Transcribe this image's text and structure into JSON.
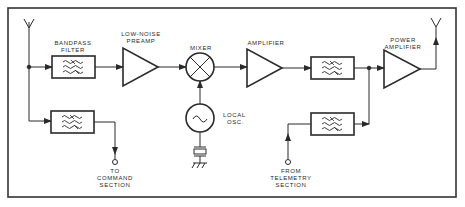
{
  "diagram": {
    "colors": {
      "line": "#2a2a2a",
      "background": "#ffffff",
      "frame": "#333333"
    },
    "labels": {
      "bandpass_filter": [
        "BANDPASS",
        "FILTER"
      ],
      "low_noise_preamp": [
        "LOW-NOISE",
        "PREAMP"
      ],
      "mixer": "MIXER",
      "amplifier": "AMPLIFIER",
      "power_amplifier": [
        "POWER",
        "AMPLIFIER"
      ],
      "local_osc": [
        "LOCAL",
        "OSC."
      ],
      "to_command": [
        "TO",
        "COMMAND",
        "SECTION"
      ],
      "from_telemetry": [
        "FROM",
        "TELEMETRY",
        "SECTION"
      ]
    },
    "blocks": [
      {
        "id": "rx-antenna",
        "type": "antenna"
      },
      {
        "id": "bandpass-filter",
        "type": "filter",
        "label": "BANDPASS FILTER"
      },
      {
        "id": "low-noise-preamp",
        "type": "amplifier",
        "label": "LOW-NOISE PREAMP"
      },
      {
        "id": "mixer",
        "type": "mixer",
        "label": "MIXER"
      },
      {
        "id": "local-osc",
        "type": "oscillator",
        "label": "LOCAL OSC."
      },
      {
        "id": "crystal",
        "type": "crystal"
      },
      {
        "id": "ground",
        "type": "ground"
      },
      {
        "id": "amplifier",
        "type": "amplifier",
        "label": "AMPLIFIER"
      },
      {
        "id": "filter-2",
        "type": "filter"
      },
      {
        "id": "power-amplifier",
        "type": "amplifier",
        "label": "POWER AMPLIFIER"
      },
      {
        "id": "tx-antenna",
        "type": "antenna"
      },
      {
        "id": "command-filter",
        "type": "filter"
      },
      {
        "id": "telemetry-filter",
        "type": "filter"
      },
      {
        "id": "command-terminal",
        "type": "terminal",
        "label": "TO COMMAND SECTION"
      },
      {
        "id": "telemetry-terminal",
        "type": "terminal",
        "label": "FROM TELEMETRY SECTION"
      }
    ],
    "connections": [
      [
        "rx-antenna",
        "bandpass-filter"
      ],
      [
        "bandpass-filter",
        "low-noise-preamp"
      ],
      [
        "low-noise-preamp",
        "mixer"
      ],
      [
        "local-osc",
        "mixer"
      ],
      [
        "crystal",
        "local-osc"
      ],
      [
        "mixer",
        "amplifier"
      ],
      [
        "amplifier",
        "filter-2"
      ],
      [
        "filter-2",
        "power-amplifier"
      ],
      [
        "power-amplifier",
        "tx-antenna"
      ],
      [
        "rx-antenna",
        "command-filter"
      ],
      [
        "command-filter",
        "command-terminal"
      ],
      [
        "telemetry-terminal",
        "telemetry-filter"
      ],
      [
        "telemetry-filter",
        "power-amplifier"
      ]
    ]
  }
}
